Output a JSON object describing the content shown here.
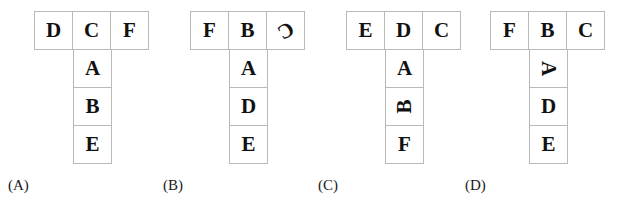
{
  "figure": {
    "kind": "cube-net-multiple-choice",
    "cell_border_color": "#b9b9b9",
    "text_color": "#111111",
    "background": "#ffffff"
  },
  "options": [
    {
      "id": "A",
      "label": "(A)",
      "left": 35,
      "label_left": 8,
      "top_row": [
        {
          "letter": "D",
          "rotation": 0
        },
        {
          "letter": "C",
          "rotation": 0
        },
        {
          "letter": "F",
          "rotation": 0
        }
      ],
      "stem": [
        {
          "letter": "A",
          "rotation": 0
        },
        {
          "letter": "B",
          "rotation": 0
        },
        {
          "letter": "E",
          "rotation": 0
        }
      ]
    },
    {
      "id": "B",
      "label": "(B)",
      "left": 191,
      "label_left": 163,
      "top_row": [
        {
          "letter": "F",
          "rotation": 0
        },
        {
          "letter": "B",
          "rotation": 0
        },
        {
          "letter": "C",
          "rotation": 150
        }
      ],
      "stem": [
        {
          "letter": "A",
          "rotation": 0
        },
        {
          "letter": "D",
          "rotation": 0
        },
        {
          "letter": "E",
          "rotation": 0
        }
      ]
    },
    {
      "id": "C",
      "label": "(C)",
      "left": 347,
      "label_left": 318,
      "top_row": [
        {
          "letter": "E",
          "rotation": 0
        },
        {
          "letter": "D",
          "rotation": 0
        },
        {
          "letter": "C",
          "rotation": 0
        }
      ],
      "stem": [
        {
          "letter": "A",
          "rotation": 0
        },
        {
          "letter": "B",
          "rotation": -90
        },
        {
          "letter": "F",
          "rotation": 0
        }
      ]
    },
    {
      "id": "D",
      "label": "(D)",
      "left": 491,
      "label_left": 465,
      "top_row": [
        {
          "letter": "F",
          "rotation": 0
        },
        {
          "letter": "B",
          "rotation": 0
        },
        {
          "letter": "C",
          "rotation": 0
        }
      ],
      "stem": [
        {
          "letter": "A",
          "rotation": 90
        },
        {
          "letter": "D",
          "rotation": 0
        },
        {
          "letter": "E",
          "rotation": 0
        }
      ]
    }
  ]
}
